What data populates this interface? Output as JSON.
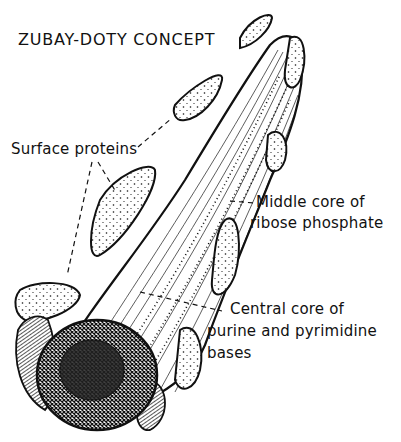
{
  "figure": {
    "title": "ZUBAY-DOTY CONCEPT",
    "labels": {
      "surface_proteins": "Surface proteins",
      "middle_core_line1": "Middle core of",
      "middle_core_line2": "ribose phosphate",
      "central_core_line1": "Central core of",
      "central_core_line2": "purine and pyrimidine",
      "central_core_line3": "bases"
    },
    "colors": {
      "ink": "#111111",
      "background": "#ffffff"
    }
  }
}
